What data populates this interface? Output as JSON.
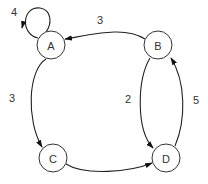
{
  "diagram": {
    "type": "directed-weighted-graph",
    "nodes": [
      {
        "id": "A",
        "label": "A",
        "x": 51,
        "y": 45
      },
      {
        "id": "B",
        "label": "B",
        "x": 158,
        "y": 45
      },
      {
        "id": "C",
        "label": "C",
        "x": 53,
        "y": 158
      },
      {
        "id": "D",
        "label": "D",
        "x": 166,
        "y": 158
      }
    ],
    "edges": [
      {
        "from": "A",
        "to": "A",
        "weight": "4"
      },
      {
        "from": "B",
        "to": "A",
        "weight": "3"
      },
      {
        "from": "A",
        "to": "C",
        "weight": "3"
      },
      {
        "from": "C",
        "to": "D",
        "weight": ""
      },
      {
        "from": "B",
        "to": "D",
        "weight": "2"
      },
      {
        "from": "D",
        "to": "B",
        "weight": "5"
      }
    ],
    "labels": {
      "aa": "4",
      "ba": "3",
      "ac": "3",
      "bd": "2",
      "db": "5"
    },
    "colors": {
      "stroke": "#222222",
      "node_fill": "#ffffff",
      "text": "#333333"
    }
  }
}
